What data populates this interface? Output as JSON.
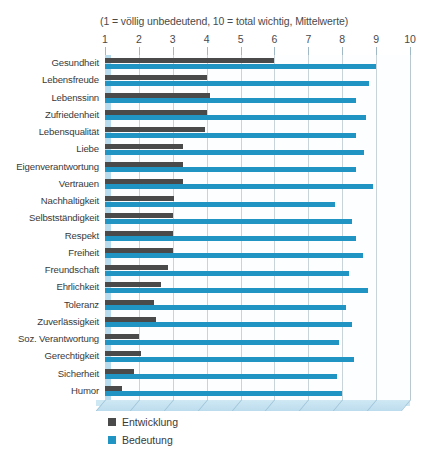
{
  "chart_data": {
    "type": "bar",
    "orientation": "horizontal",
    "title": "",
    "subtitle": "(1 = völlig unbedeutend, 10 = total wichtig, Mittelwerte)",
    "xlabel": "",
    "ylabel": "",
    "xlim": [
      1,
      10
    ],
    "xticks": [
      "1",
      "2",
      "3",
      "4",
      "5",
      "6",
      "7",
      "8",
      "9",
      "10"
    ],
    "grid": true,
    "legend_position": "bottom-left",
    "categories": [
      "Gesundheit",
      "Lebensfreude",
      "Lebenssinn",
      "Zufriedenheit",
      "Lebensqualität",
      "Liebe",
      "Eigenverantwortung",
      "Vertrauen",
      "Nachhaltigkeit",
      "Selbstständigkeit",
      "Respekt",
      "Freiheit",
      "Freundschaft",
      "Ehrlichkeit",
      "Toleranz",
      "Zuverlässigkeit",
      "Soz. Verantwortung",
      "Gerechtigkeit",
      "Sicherheit",
      "Humor"
    ],
    "series": [
      {
        "name": "Entwicklung",
        "color": "#4a4a4a",
        "values": [
          6.0,
          4.0,
          4.1,
          4.0,
          3.95,
          3.3,
          3.3,
          3.3,
          3.05,
          3.0,
          3.0,
          3.0,
          2.85,
          2.65,
          2.45,
          2.5,
          2.0,
          2.05,
          1.85,
          1.5
        ]
      },
      {
        "name": "Bedeutung",
        "color": "#2095c4",
        "values": [
          9.0,
          8.8,
          8.4,
          8.7,
          8.4,
          8.65,
          8.4,
          8.9,
          7.8,
          8.3,
          8.4,
          8.6,
          8.2,
          8.75,
          8.1,
          8.3,
          7.9,
          8.35,
          7.85,
          8.0
        ]
      }
    ]
  },
  "legend": {
    "items": [
      {
        "label": "Entwicklung",
        "color": "#4a4a4a"
      },
      {
        "label": "Bedeutung",
        "color": "#2095c4"
      }
    ]
  },
  "colors": {
    "development": "#4a4a4a",
    "importance": "#2095c4",
    "grid": "#c8d4da",
    "floor": "#c3e1f0",
    "plot_background": "#fdfeff"
  }
}
